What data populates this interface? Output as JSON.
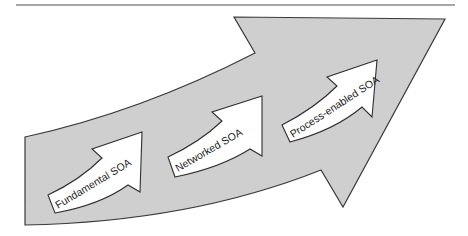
{
  "diagram": {
    "type": "progression-arrows",
    "colors": {
      "big_arrow_fill": "#cfcfcf",
      "big_arrow_stroke": "#3a3a3a",
      "small_arrow_fill": "#ffffff",
      "rule": "#8a8a8a",
      "text": "#222222"
    },
    "stages": [
      {
        "label": "Fundamental SOA",
        "order": 1
      },
      {
        "label": "Networked SOA",
        "order": 2
      },
      {
        "label": "Process-enabled SOA",
        "order": 3
      }
    ]
  }
}
